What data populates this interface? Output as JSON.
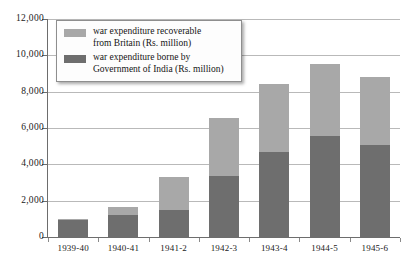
{
  "chart_data": {
    "type": "bar",
    "subtype": "stacked-vertical",
    "title": "",
    "xlabel": "",
    "ylabel": "",
    "ylim": [
      0,
      12000
    ],
    "ytick_values": [
      0,
      2000,
      4000,
      6000,
      8000,
      10000,
      12000
    ],
    "ytick_labels": [
      "0",
      "2,000",
      "4,000",
      "6,000",
      "8,000",
      "10,000",
      "12,000"
    ],
    "grid": "horizontal",
    "legend_position": "top-left-inside",
    "categories": [
      "1939-40",
      "1940-41",
      "1941-2",
      "1942-3",
      "1943-4",
      "1944-5",
      "1945-6"
    ],
    "series": [
      {
        "name": "war expenditure borne by\nGovernment of India (Rs. million)",
        "short_name": "borne by Government of India",
        "color": "#6e6e6e",
        "values": [
          950,
          1200,
          1500,
          3350,
          4700,
          5550,
          5050
        ]
      },
      {
        "name": "war expenditure recoverable\nfrom Britain (Rs. million)",
        "short_name": "recoverable from Britain",
        "color": "#a8a8a8",
        "values": [
          50,
          450,
          1800,
          3200,
          3750,
          4000,
          3750
        ]
      }
    ],
    "totals": [
      1000,
      1650,
      3300,
      6550,
      8450,
      9550,
      8800
    ],
    "units": "Rs. million"
  },
  "legend": {
    "entries": [
      {
        "label": "war expenditure recoverable\nfrom Britain (Rs. million)",
        "color": "#a8a8a8",
        "swatch_name": "legend-swatch-recoverable"
      },
      {
        "label": "war expenditure borne by\nGovernment of India (Rs. million)",
        "color": "#6e6e6e",
        "swatch_name": "legend-swatch-india"
      }
    ]
  },
  "colors": {
    "light_gray": "#a8a8a8",
    "dark_gray": "#6e6e6e",
    "grid": "#b9b9b9",
    "axis": "#6d6d6d",
    "text": "#1a1a1a",
    "background": "#ffffff"
  }
}
